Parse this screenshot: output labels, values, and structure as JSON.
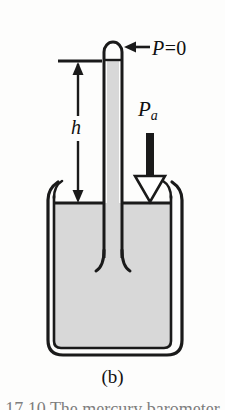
{
  "figure": {
    "kind": "barometer-diagram",
    "caption": "(b)",
    "caption_cutoff": "17.10   The mercury barometer",
    "colors": {
      "ink": "#1a1a1a",
      "liquid_fill": "#d8d8d8",
      "background": "#fdfdfc",
      "arrow_fill": "#ffffff"
    },
    "labels": {
      "vacuum_pressure": "P = 0",
      "vacuum_pressure_symbol": "P",
      "vacuum_pressure_equals": "=",
      "vacuum_pressure_value": "0",
      "atmospheric_pressure": "P",
      "atmospheric_pressure_subscript": "a",
      "height": "h"
    },
    "annotations": {
      "vacuum_arrow": "left-pointing arrow to sealed tube top",
      "atmosphere_arrow": "down-pointing open arrow onto liquid surface",
      "height_arrow": "double-headed vertical dimension arrow"
    },
    "geometry": {
      "tube_left": 104,
      "tube_right": 122,
      "tube_top": 42,
      "liquid_surface_y": 203,
      "tube_bottom_y": 270,
      "beaker_left": 47,
      "beaker_right": 183,
      "beaker_bottom_y": 355,
      "height_top_y": 61,
      "height_bottom_y": 203,
      "height_arrow_x": 78
    }
  }
}
